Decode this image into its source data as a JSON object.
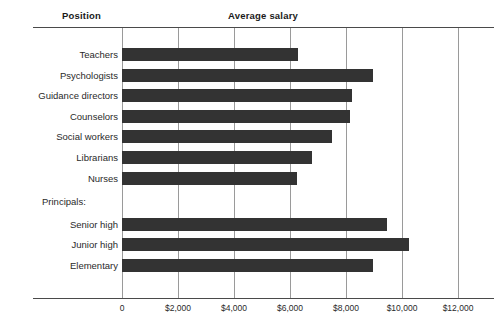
{
  "header": {
    "position_label": "Position",
    "salary_label": "Average salary"
  },
  "group_heading": "Principals:",
  "chart_data": {
    "type": "bar",
    "orientation": "horizontal",
    "title": "",
    "xlabel": "Average salary",
    "ylabel": "Position",
    "xlim": [
      0,
      12000
    ],
    "grid": true,
    "legend": "none",
    "tick_labels": [
      "0",
      "$2,000",
      "$4,000",
      "$6,000",
      "$8,000",
      "$10,000",
      "$12,000"
    ],
    "tick_values": [
      0,
      2000,
      4000,
      6000,
      8000,
      10000,
      12000
    ],
    "bar_color": "#333333",
    "categories": [
      "Teachers",
      "Psychologists",
      "Guidance directors",
      "Counselors",
      "Social workers",
      "Librarians",
      "Nurses",
      "Senior high",
      "Junior high",
      "Elementary"
    ],
    "values": [
      6300,
      8950,
      8200,
      8150,
      7500,
      6800,
      6250,
      9450,
      10250,
      8950
    ],
    "groups": [
      {
        "name": "",
        "categories": [
          "Teachers",
          "Psychologists",
          "Guidance directors",
          "Counselors",
          "Social workers",
          "Librarians",
          "Nurses"
        ]
      },
      {
        "name": "Principals:",
        "categories": [
          "Senior high",
          "Junior high",
          "Elementary"
        ]
      }
    ]
  }
}
